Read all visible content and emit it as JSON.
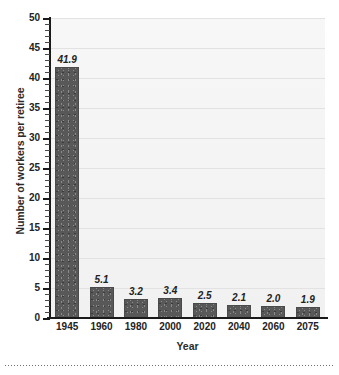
{
  "chart_data": {
    "type": "bar",
    "title": "",
    "xlabel": "Year",
    "ylabel": "Number of workers per retiree",
    "categories": [
      "1945",
      "1960",
      "1980",
      "2000",
      "2020",
      "2040",
      "2060",
      "2075"
    ],
    "values": [
      41.9,
      5.1,
      3.2,
      3.4,
      2.5,
      2.1,
      2.0,
      1.9
    ],
    "value_labels": [
      "41.9",
      "5.1",
      "3.2",
      "3.4",
      "2.5",
      "2.1",
      "2.0",
      "1.9"
    ],
    "ylim": [
      0,
      50
    ],
    "y_ticks": [
      0,
      5,
      10,
      15,
      20,
      25,
      30,
      35,
      40,
      45,
      50
    ],
    "y_tick_labels": [
      "0",
      "5",
      "10",
      "15",
      "20",
      "25",
      "30",
      "35",
      "40",
      "45",
      "50"
    ],
    "y_minor_tick_interval": 1,
    "grid": true,
    "grid_axis": "y",
    "legend": false,
    "legend_position": "none",
    "bar_color": "#585858",
    "bar_pattern": "speckled-dots",
    "plot_background": "#f4f4f4",
    "gridline_color": "#e2e2e2",
    "axis_color": "#1a1a1a",
    "text_color": "#232323",
    "value_label_style": "italic-bold"
  },
  "figure": {
    "background": "#ffffff",
    "footer_rule": "dotted-divider"
  }
}
